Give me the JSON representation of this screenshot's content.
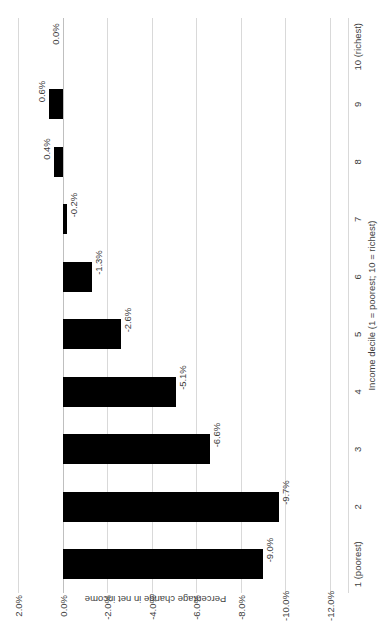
{
  "chart_data": {
    "type": "bar",
    "title": "",
    "orientation": "vertical-bars-rotated-90",
    "xlabel": "Income decile (1 = poorest; 10 = richest)",
    "ylabel": "Percentage change in net income",
    "categories": [
      "1 (poorest)",
      "2",
      "3",
      "4",
      "5",
      "6",
      "7",
      "8",
      "9",
      "10 (richest)"
    ],
    "values": [
      -9.0,
      -9.7,
      -6.6,
      -5.1,
      -2.6,
      -1.3,
      -0.2,
      0.4,
      0.6,
      0.0
    ],
    "data_labels": [
      "-9.0%",
      "-9.7%",
      "-6.6%",
      "-5.1%",
      "-2.6%",
      "-1.3%",
      "-0.2%",
      "0.4%",
      "0.6%",
      "0.0%"
    ],
    "ylim": [
      -12.0,
      2.0
    ],
    "ytick_values": [
      2.0,
      0.0,
      -2.0,
      -4.0,
      -6.0,
      -8.0,
      -10.0,
      -12.0
    ],
    "ytick_labels": [
      "2.0%",
      "0.0%",
      "-2.0%",
      "-4.0%",
      "-6.0%",
      "-8.0%",
      "-10.0%",
      "-12.0%"
    ],
    "grid": true,
    "legend": false,
    "bar_color": "#000000",
    "gridline_color": "#d9d9d9",
    "text_color": "#404040",
    "background": "#ffffff"
  }
}
